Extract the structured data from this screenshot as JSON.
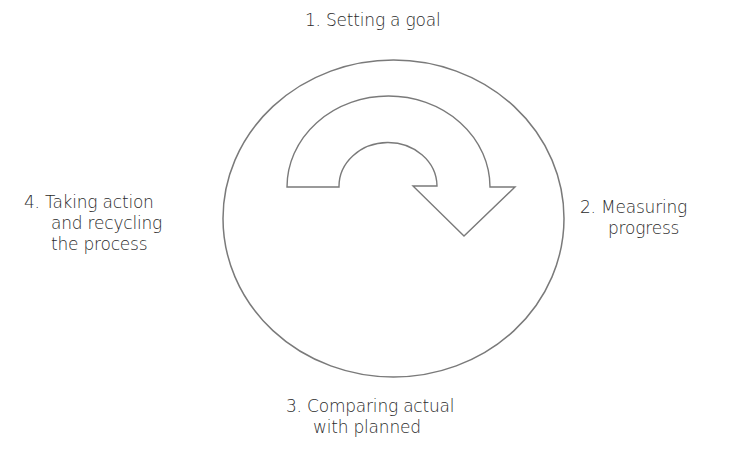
{
  "diagram": {
    "type": "cycle",
    "center_shape": "circle",
    "center_arrow": "curved-clockwise-arrow",
    "stroke_color": "#7a7a7a",
    "steps": [
      {
        "number": "1.",
        "lines": [
          "1. Setting a goal"
        ],
        "position": "top"
      },
      {
        "number": "2.",
        "lines": [
          "2. Measuring",
          "progress"
        ],
        "position": "right"
      },
      {
        "number": "3.",
        "lines": [
          "3. Comparing actual",
          "with planned"
        ],
        "position": "bottom"
      },
      {
        "number": "4.",
        "lines": [
          "4. Taking action",
          "and recycling",
          "the process"
        ],
        "position": "left"
      }
    ]
  }
}
